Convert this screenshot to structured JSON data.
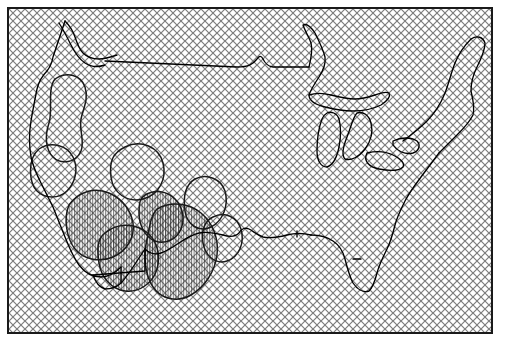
{
  "figure": {
    "kind": "map",
    "region": "contiguous-united-states",
    "title": "",
    "caption": "",
    "frame": {
      "x": 7,
      "y": 7,
      "width": 486,
      "height": 327,
      "border_color": "#1a1a1a",
      "border_width": 2
    },
    "background_color": "#ffffff"
  },
  "layers": {
    "crosshatch": {
      "name": "background-crosshatch-fill",
      "description": "diagonal cross-hatch covering the entire map frame",
      "line_color": "#808080",
      "line_width": 1.1,
      "spacing": 8,
      "angles": [
        45,
        -45
      ]
    },
    "vertical_hatch": {
      "name": "vertical-line-hatch",
      "description": "dense vertical line hatching inside southwestern contour regions",
      "line_color": "#333333",
      "line_width": 0.7,
      "spacing": 2.6,
      "angle": 90
    },
    "coastline": {
      "name": "coastline-and-border",
      "line_color": "#000000",
      "line_width": 1.3
    },
    "contours": {
      "name": "contour-lines",
      "line_color": "#1a1a1a",
      "line_width": 1.5,
      "count": 9
    }
  },
  "geometry": {
    "outline": "M 22,120 L 21,108 L 23,96 L 22,86 L 25,74 L 24,62 L 27,52 L 31,44 L 30,36 L 33,28 L 37,22 L 43,19 L 47,24 L 50,31 L 53,38 L 57,42 L 62,44 L 66,41 L 70,40 L 76,42 L 82,44 L 90,45 L 104,46 L 122,48 L 146,51 L 170,54 L 196,57 L 222,59 L 246,61 L 250,56 L 253,53 L 256,57 L 258,62 L 262,63 L 276,64 L 288,64 L 292,60 L 296,54 L 300,47 L 303,40 L 300,33 L 296,28 L 293,22 L 297,19 L 303,22 L 309,28 L 313,35 L 316,43 L 320,51 L 318,59 L 314,66 L 311,73 L 308,80 L 312,86 L 318,89 L 324,92 L 330,96 L 336,99 L 342,101 L 348,104 L 352,110 L 356,116 L 360,121 L 364,124 L 370,126 L 376,125 L 382,122 L 388,118 L 394,114 L 399,108 L 404,101 L 408,94 L 412,86 L 415,78 L 418,70 L 421,62 L 424,54 L 428,46 L 432,38 L 437,31 L 443,26 L 449,24 L 455,26 L 458,32 L 456,40 L 452,47 L 449,55 L 448,63 L 450,71 L 452,79 L 450,87 L 446,94 L 442,101 L 438,108 L 434,116 L 430,124 L 426,132 L 422,140 L 418,148 L 414,156 L 410,164 L 406,172 L 402,180 L 398,188 L 394,196 L 391,204 L 389,212 L 388,220 L 386,228 L 383,235 L 379,241 L 376,248 L 375,256 L 376,264 L 374,271 L 370,277 L 365,281 L 359,282 L 353,279 L 348,274 L 344,268 L 341,261 L 338,254 L 335,247 L 331,241 L 326,237 L 320,235 L 314,234 L 308,234 L 302,233 L 296,231 L 290,229 L 284,228 L 278,229 L 272,231 L 266,232 L 260,231 L 254,229 L 248,228 L 242,229 L 236,231 L 230,232 L 224,231 L 218,229 L 212,228 L 206,229 L 200,231 L 194,232 L 188,231 L 182,229 L 176,228 L 170,229 L 164,231 L 158,234 L 152,238 L 146,243 L 141,248 L 136,253 L 131,258 L 126,262 L 120,264 L 114,263 L 108,260 L 103,256 L 98,251 L 94,245 L 90,239 L 86,233 L 82,227 L 78,221 L 74,215 L 70,209 L 66,203 L 62,197 L 58,191 L 54,185 L 50,179 L 46,173 L 42,167 L 38,161 L 34,154 L 31,147 L 28,140 L 25,133 L 23,126 Z",
    "canada_border_y": 52,
    "great_lakes_center": [
      330,
      105
    ],
    "florida_tip": [
      365,
      282
    ]
  },
  "hatched_regions": [
    {
      "name": "southwest-hatch-a",
      "center": [
        98,
        215
      ]
    },
    {
      "name": "southwest-hatch-b",
      "center": [
        128,
        240
      ]
    },
    {
      "name": "texas-hatch",
      "center": [
        180,
        245
      ]
    },
    {
      "name": "arizona-hatch",
      "center": [
        155,
        210
      ]
    }
  ],
  "contour_blobs": [
    {
      "name": "contour-blob-idaho",
      "center": [
        62,
        105
      ]
    },
    {
      "name": "contour-blob-nevada",
      "center": [
        72,
        170
      ]
    },
    {
      "name": "contour-blob-utah",
      "center": [
        138,
        165
      ]
    },
    {
      "name": "contour-blob-colorado",
      "center": [
        196,
        195
      ]
    },
    {
      "name": "contour-blob-newmexico",
      "center": [
        218,
        240
      ]
    }
  ]
}
